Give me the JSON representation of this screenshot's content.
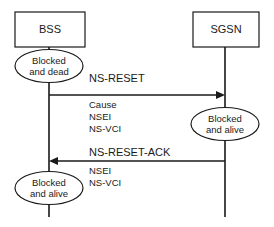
{
  "diagram": {
    "type": "sequence-diagram",
    "background_color": "#ffffff",
    "line_color": "#1a1a1a",
    "participants": [
      {
        "id": "bss",
        "label": "BSS",
        "lifeline_x": 49
      },
      {
        "id": "sgsn",
        "label": "SGSN",
        "lifeline_x": 225
      }
    ],
    "states": [
      {
        "id": "bss-state-1",
        "owner": "bss",
        "line1": "Blocked",
        "line2": "and dead"
      },
      {
        "id": "sgsn-state-1",
        "owner": "sgsn",
        "line1": "Blocked",
        "line2": "and alive"
      },
      {
        "id": "bss-state-2",
        "owner": "bss",
        "line1": "Blocked",
        "line2": "and alive"
      }
    ],
    "messages": [
      {
        "id": "ns-reset",
        "label": "NS-RESET",
        "from": "bss",
        "to": "sgsn",
        "direction": "right",
        "parameters": [
          "Cause",
          "NSEI",
          "NS-VCI"
        ]
      },
      {
        "id": "ns-reset-ack",
        "label": "NS-RESET-ACK",
        "from": "sgsn",
        "to": "bss",
        "direction": "left",
        "parameters": [
          "NSEI",
          "NS-VCI"
        ]
      }
    ]
  }
}
